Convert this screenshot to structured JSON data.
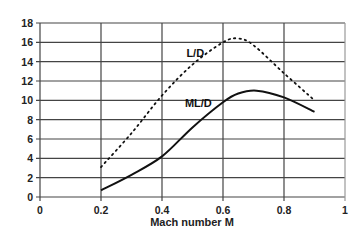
{
  "chart_data": {
    "type": "line",
    "title": "",
    "xlabel": "Mach number M",
    "ylabel": "",
    "xlim": [
      0,
      1
    ],
    "ylim": [
      0,
      18
    ],
    "x_ticks": [
      "0",
      "0.2",
      "0.4",
      "0.6",
      "0.8",
      "1"
    ],
    "y_ticks": [
      "0",
      "2",
      "4",
      "6",
      "8",
      "10",
      "12",
      "14",
      "16",
      "18"
    ],
    "grid": true,
    "legend": "inline labels",
    "series": [
      {
        "name": "L/D",
        "style": "dotted",
        "x": [
          0.2,
          0.3,
          0.4,
          0.5,
          0.6,
          0.65,
          0.7,
          0.8,
          0.9
        ],
        "values": [
          3.1,
          6.6,
          10.5,
          13.7,
          16.0,
          16.4,
          15.7,
          12.8,
          10.0
        ],
        "label_pos": [
          0.48,
          14.5
        ]
      },
      {
        "name": "ML/D",
        "style": "solid",
        "x": [
          0.2,
          0.3,
          0.4,
          0.5,
          0.6,
          0.65,
          0.71,
          0.8,
          0.9
        ],
        "values": [
          0.7,
          2.3,
          4.2,
          7.2,
          9.8,
          10.7,
          11.0,
          10.3,
          8.8
        ],
        "label_pos": [
          0.475,
          9.3
        ]
      }
    ]
  },
  "colors": {
    "grid": "#444444",
    "frame": "#999999",
    "series": "#111111"
  }
}
